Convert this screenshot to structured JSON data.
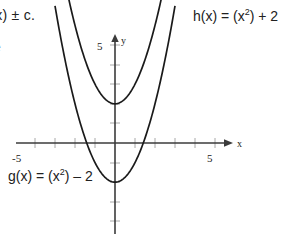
{
  "annotations": {
    "top_left_partial": "f(x) ± c.",
    "left_partial": "e",
    "h_label": {
      "prefix": "h(x) = (x",
      "exponent": "2",
      "suffix": ") + 2"
    },
    "g_label": {
      "prefix": "g(x) = (x",
      "exponent": "2",
      "suffix": ") – 2"
    }
  },
  "axes": {
    "x_axis_name": "x",
    "y_axis_name": "y",
    "x_left_tick_label": "-5",
    "x_right_tick_label": "5",
    "y_top_tick_label": "5"
  },
  "colors": {
    "curve": "#1a1a1a",
    "axis": "#3b3b3b",
    "tick": "#a8a8a8",
    "text": "#212121",
    "background": "#ffffff"
  },
  "chart_data": {
    "type": "line",
    "title": "",
    "xlabel": "x",
    "ylabel": "y",
    "xlim": [
      -5.5,
      5.5
    ],
    "ylim": [
      -5.5,
      5.5
    ],
    "grid": false,
    "legend": "inline-annotations",
    "xticks": [
      -5,
      -4,
      -3,
      -2,
      -1,
      0,
      1,
      2,
      3,
      4,
      5
    ],
    "yticks": [
      -5,
      -4,
      -3,
      -2,
      -1,
      0,
      1,
      2,
      3,
      4,
      5
    ],
    "xtick_labels_shown": [
      "-5",
      "5"
    ],
    "ytick_labels_shown": [
      "5"
    ],
    "series": [
      {
        "name": "h(x) = (x^2) + 2",
        "equation": "y = x^2 + 2",
        "vertex": [
          0,
          2
        ],
        "x": [
          -2.6,
          -2.2,
          -1.8,
          -1.4,
          -1.0,
          -0.6,
          -0.2,
          0,
          0.2,
          0.6,
          1.0,
          1.4,
          1.8,
          2.2,
          2.6
        ],
        "values": [
          8.76,
          6.84,
          5.24,
          3.96,
          3.0,
          2.36,
          2.04,
          2.0,
          2.04,
          2.36,
          3.0,
          3.96,
          5.24,
          6.84,
          8.76
        ]
      },
      {
        "name": "g(x) = (x^2) - 2",
        "equation": "y = x^2 - 2",
        "vertex": [
          0,
          -2
        ],
        "x": [
          -2.8,
          -2.4,
          -2.0,
          -1.6,
          -1.2,
          -0.8,
          -0.4,
          0,
          0.4,
          0.8,
          1.2,
          1.6,
          2.0,
          2.4,
          2.8
        ],
        "values": [
          5.84,
          3.76,
          2.0,
          0.56,
          -0.56,
          -1.36,
          -1.84,
          -2.0,
          -1.84,
          -1.36,
          -0.56,
          0.56,
          2.0,
          3.76,
          5.84
        ]
      }
    ]
  }
}
